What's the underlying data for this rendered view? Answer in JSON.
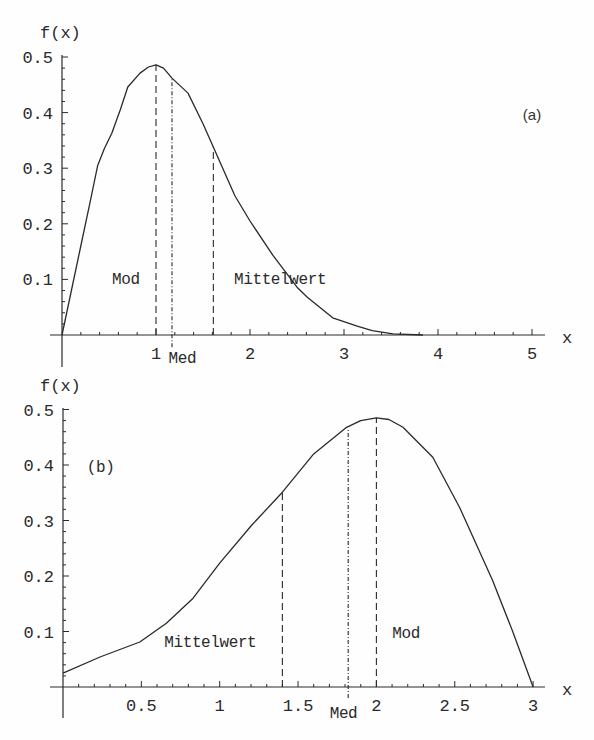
{
  "colors": {
    "ink": "#2a2a2a",
    "background": "#fefefe"
  },
  "chart_data": [
    {
      "panel": "a",
      "type": "line",
      "title": "",
      "panel_label": "(a)",
      "xlabel": "x",
      "ylabel": "f(x)",
      "xlim": [
        0,
        5
      ],
      "ylim": [
        0,
        0.5
      ],
      "grid": false,
      "legend": null,
      "xticks": [
        1,
        2,
        3,
        4,
        5
      ],
      "xtick_labels": [
        "1",
        "2",
        "3",
        "4",
        "5"
      ],
      "yticks": [
        0.1,
        0.2,
        0.3,
        0.4,
        0.5
      ],
      "ytick_labels": [
        "0.1",
        "0.2",
        "0.3",
        "0.4",
        "0.5"
      ],
      "series": [
        {
          "name": "f(x)",
          "x": [
            0,
            0.1,
            0.2,
            0.3,
            0.38,
            0.45,
            0.53,
            0.62,
            0.7,
            0.83,
            0.92,
            1.0,
            1.08,
            1.17,
            1.34,
            1.5,
            1.61,
            1.84,
            2.0,
            2.24,
            2.5,
            2.61,
            2.88,
            3.14,
            3.3,
            3.52,
            3.84
          ],
          "y": [
            0,
            0.08,
            0.16,
            0.24,
            0.305,
            0.335,
            0.363,
            0.405,
            0.446,
            0.471,
            0.482,
            0.486,
            0.48,
            0.462,
            0.435,
            0.38,
            0.338,
            0.25,
            0.205,
            0.144,
            0.086,
            0.068,
            0.031,
            0.016,
            0.008,
            0.002,
            0.0
          ]
        }
      ],
      "markers": [
        {
          "name": "Mod",
          "x": 1.0,
          "y_top": 0.486,
          "y_bottom": 0,
          "style": "dashed"
        },
        {
          "name": "Med",
          "x": 1.17,
          "y_top": 0.462,
          "y_bottom": -0.022,
          "style": "dashdot"
        },
        {
          "name": "Mittelwert",
          "x": 1.61,
          "y_top": 0.338,
          "y_bottom": 0,
          "style": "dashed"
        }
      ],
      "annotations": [
        {
          "id": "mod-label",
          "text": "Mod",
          "x": 0.68,
          "y": 0.1,
          "font": "mono"
        },
        {
          "id": "med-label",
          "text": "Med",
          "x": 1.28,
          "y": -0.042,
          "font": "mono"
        },
        {
          "id": "mittelwert-label",
          "text": "Mittelwert",
          "x": 2.32,
          "y": 0.1,
          "font": "mono"
        },
        {
          "id": "panel-label",
          "text": "(a)",
          "x": 5.0,
          "y": 0.396,
          "font": "sans"
        }
      ]
    },
    {
      "panel": "b",
      "type": "line",
      "title": "",
      "panel_label": "(b)",
      "xlabel": "x",
      "ylabel": "f(x)",
      "xlim": [
        0,
        3
      ],
      "ylim": [
        0,
        0.5
      ],
      "grid": false,
      "legend": null,
      "xticks": [
        0.5,
        1,
        1.5,
        2,
        2.5,
        3
      ],
      "xtick_labels": [
        "0.5",
        "1",
        "1.5",
        "2",
        "2.5",
        "3"
      ],
      "yticks": [
        0.1,
        0.2,
        0.3,
        0.4,
        0.5
      ],
      "ytick_labels": [
        "0.1",
        "0.2",
        "0.3",
        "0.4",
        "0.5"
      ],
      "series": [
        {
          "name": "f(x)",
          "x": [
            0,
            0.236,
            0.49,
            0.66,
            0.83,
            1.0,
            1.2,
            1.4,
            1.6,
            1.81,
            1.9,
            2.0,
            2.08,
            2.17,
            2.36,
            2.53,
            2.74,
            2.87,
            3.0
          ],
          "y": [
            0.025,
            0.054,
            0.081,
            0.115,
            0.16,
            0.223,
            0.29,
            0.351,
            0.42,
            0.468,
            0.48,
            0.485,
            0.482,
            0.468,
            0.414,
            0.324,
            0.193,
            0.1,
            0.0
          ]
        }
      ],
      "markers": [
        {
          "name": "Mittelwert",
          "x": 1.4,
          "y_top": 0.351,
          "y_bottom": 0,
          "style": "dashed"
        },
        {
          "name": "Med",
          "x": 1.82,
          "y_top": 0.466,
          "y_bottom": -0.02,
          "style": "dashdot"
        },
        {
          "name": "Mod",
          "x": 2.0,
          "y_top": 0.485,
          "y_bottom": 0,
          "style": "dashed"
        }
      ],
      "annotations": [
        {
          "id": "panel-label",
          "text": "(b)",
          "x": 0.24,
          "y": 0.396,
          "font": "mono"
        },
        {
          "id": "mittelwert-label",
          "text": "Mittelwert",
          "x": 0.94,
          "y": 0.081,
          "font": "mono"
        },
        {
          "id": "mod-label",
          "text": "Mod",
          "x": 2.19,
          "y": 0.097,
          "font": "mono"
        },
        {
          "id": "med-label",
          "text": "Med",
          "x": 1.79,
          "y": -0.046,
          "font": "mono"
        }
      ]
    }
  ]
}
